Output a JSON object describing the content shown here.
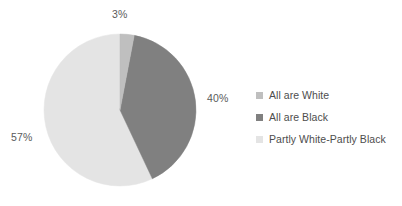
{
  "chart_data": {
    "type": "pie",
    "title": "",
    "subtitle": "",
    "categories": [
      "All are White",
      "All are Black",
      "Partly White-Partly Black"
    ],
    "values": [
      3,
      40,
      57
    ],
    "value_labels": [
      "3%",
      "40%",
      "57%"
    ],
    "unit": "%",
    "colors": [
      "#bfbfbf",
      "#808080",
      "#e4e4e4"
    ],
    "start_angle_deg": 0,
    "direction": "clockwise",
    "legend": {
      "position": "right",
      "entries": [
        {
          "label": "All are White",
          "color": "#bfbfbf",
          "swatch_icon": "legend-swatch-icon"
        },
        {
          "label": "All are Black",
          "color": "#808080",
          "swatch_icon": "legend-swatch-icon"
        },
        {
          "label": "Partly White-Partly Black",
          "color": "#e4e4e4",
          "swatch_icon": "legend-swatch-icon"
        }
      ]
    },
    "data_labels": {
      "show": true,
      "color": "#5a5a5a",
      "items": [
        {
          "category": "All are White",
          "text": "3%",
          "placement": "outside-top"
        },
        {
          "category": "All are Black",
          "text": "40%",
          "placement": "outside-right"
        },
        {
          "category": "Partly White-Partly Black",
          "text": "57%",
          "placement": "outside-left"
        }
      ]
    },
    "background_color": "#ffffff",
    "grid": false,
    "xlabel": "",
    "ylabel": ""
  }
}
